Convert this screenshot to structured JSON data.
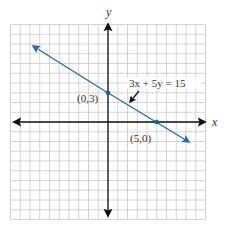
{
  "chart_data": {
    "type": "line",
    "title": "",
    "xlabel": "x",
    "ylabel": "y",
    "xlim": [
      -10,
      10
    ],
    "ylim": [
      -10,
      10
    ],
    "grid": true,
    "grid_step": 1,
    "tick_labels": false,
    "series": [
      {
        "name": "3x + 5y = 15",
        "equation": "3x + 5y = 15",
        "color": "#2a6ea6",
        "x": [
          -8,
          0,
          5,
          8.5
        ],
        "y": [
          7.8,
          3,
          0,
          -2.1
        ],
        "arrows": "both"
      }
    ],
    "points": [
      {
        "x": 0,
        "y": 3,
        "label": "(0,3)"
      },
      {
        "x": 5,
        "y": 0,
        "label": "(5,0)"
      }
    ],
    "annotations": [
      {
        "text": "3x + 5y = 15",
        "points_to": "line",
        "style": "arrow"
      }
    ]
  },
  "labels": {
    "x_axis": "x",
    "y_axis": "y",
    "equation": "3x + 5y = 15",
    "point_a": "(0,3)",
    "point_b": "(5,0)"
  },
  "colors": {
    "line": "#2a6ea6",
    "grid": "#c9c9c9",
    "axis": "#111111"
  }
}
